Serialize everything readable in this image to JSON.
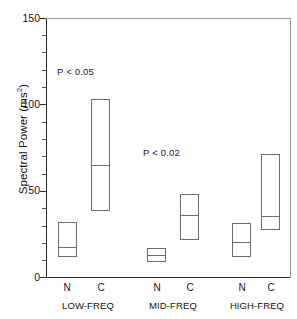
{
  "chart_data": {
    "type": "box",
    "title": "",
    "xlabel": "",
    "ylabel": "Spectral Power (ms",
    "ylabel_sup": "2",
    "ylabel_suffix": ")",
    "ylim": [
      0,
      150
    ],
    "yticks": [
      0,
      50,
      100,
      150
    ],
    "ytick_labels": [
      "0",
      "50",
      "100",
      "150"
    ],
    "yminor_step": 10,
    "grid": false,
    "legend": "none",
    "categories": [
      "LOW-FREQ",
      "MID-FREQ",
      "HIGH-FREQ"
    ],
    "condition_labels": [
      "N",
      "C"
    ],
    "boxes": [
      {
        "group": "LOW-FREQ",
        "condition": "N",
        "upper": 32.0,
        "median": 17.4,
        "lower": 11.6
      },
      {
        "group": "LOW-FREQ",
        "condition": "C",
        "upper": 103.0,
        "median": 65.0,
        "lower": 38.2
      },
      {
        "group": "MID-FREQ",
        "condition": "N",
        "upper": 17.0,
        "median": 12.8,
        "lower": 8.8
      },
      {
        "group": "MID-FREQ",
        "condition": "C",
        "upper": 48.0,
        "median": 35.8,
        "lower": 21.4
      },
      {
        "group": "HIGH-FREQ",
        "condition": "N",
        "upper": 31.5,
        "median": 20.0,
        "lower": 11.5
      },
      {
        "group": "HIGH-FREQ",
        "condition": "C",
        "upper": 71.5,
        "median": 35.5,
        "lower": 27.5
      }
    ],
    "annotations": [
      {
        "text": "P < 0.05",
        "x_group": "LOW-FREQ",
        "y_value": 128
      },
      {
        "text": "P < 0.02",
        "x_group": "MID-FREQ",
        "y_value": 91
      }
    ]
  },
  "axis": {
    "y_title_main": "Spectral Power (ms",
    "y_title_sup": "2",
    "y_title_end": ")",
    "ytick_0": "0",
    "ytick_50": "50",
    "ytick_100": "100",
    "ytick_150": "150"
  },
  "xaxis": {
    "ticks": [
      {
        "label": "N"
      },
      {
        "label": "C"
      },
      {
        "label": "N"
      },
      {
        "label": "C"
      },
      {
        "label": "N"
      },
      {
        "label": "C"
      }
    ],
    "groups": [
      {
        "label": "LOW-FREQ"
      },
      {
        "label": "MID-FREQ"
      },
      {
        "label": "HIGH-FREQ"
      }
    ]
  },
  "annotations": [
    {
      "text": "P < 0.05"
    },
    {
      "text": "P < 0.02"
    }
  ]
}
